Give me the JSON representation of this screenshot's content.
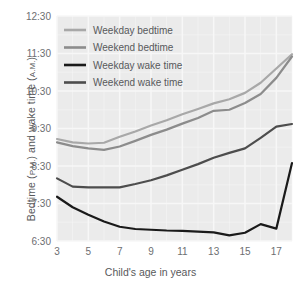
{
  "chart_data": {
    "type": "line",
    "title": "",
    "xlabel": "Child's age in years",
    "ylabel": "Bedtime (P.M.) and wake time (A.M.)",
    "ylabel_main": "Bedtime (",
    "ylabel_pm": "P.M.",
    "ylabel_mid": ") and wake time (",
    "ylabel_am": "A.M.",
    "ylabel_end": ")",
    "grid": true,
    "legend_position": "top-left",
    "xlim": [
      3,
      18
    ],
    "ylim_hours": [
      6.5,
      12.5
    ],
    "x_ticks": [
      "3",
      "5",
      "7",
      "9",
      "11",
      "13",
      "15",
      "17"
    ],
    "x_tick_values": [
      3,
      5,
      7,
      9,
      11,
      13,
      15,
      17
    ],
    "y_ticks": [
      "6:30",
      "7:30",
      "8:30",
      "9:30",
      "10:30",
      "11:30",
      "12:30"
    ],
    "y_tick_values": [
      6.5,
      7.5,
      8.5,
      9.5,
      10.5,
      11.5,
      12.5
    ],
    "x": [
      3,
      4,
      5,
      6,
      7,
      8,
      9,
      10,
      11,
      12,
      13,
      14,
      15,
      16,
      17,
      18
    ],
    "series": [
      {
        "name": "Weekday bedtime",
        "color": "#a8a8a8",
        "values": [
          9.22,
          9.13,
          9.1,
          9.12,
          9.28,
          9.42,
          9.58,
          9.72,
          9.88,
          10.02,
          10.17,
          10.28,
          10.45,
          10.72,
          11.1,
          11.48
        ],
        "value_labels": [
          "9:13",
          "9:08",
          "9:06",
          "9:07",
          "9:17",
          "9:25",
          "9:35",
          "9:43",
          "9:53",
          "10:01",
          "10:10",
          "10:17",
          "10:27",
          "10:43",
          "11:06",
          "11:29"
        ]
      },
      {
        "name": "Weekend bedtime",
        "color": "#8c8c8c",
        "values": [
          9.13,
          9.03,
          8.97,
          8.93,
          9.02,
          9.17,
          9.33,
          9.47,
          9.63,
          9.78,
          9.97,
          10.0,
          10.18,
          10.42,
          10.85,
          11.42
        ],
        "value_labels": [
          "9:08",
          "9:02",
          "8:58",
          "8:56",
          "9:01",
          "9:10",
          "9:20",
          "9:28",
          "9:38",
          "9:47",
          "9:58",
          "10:00",
          "10:11",
          "10:25",
          "10:51",
          "11:25"
        ]
      },
      {
        "name": "Weekday wake time",
        "color": "#1a1a1a",
        "values": [
          7.68,
          7.4,
          7.2,
          7.02,
          6.88,
          6.82,
          6.8,
          6.78,
          6.77,
          6.75,
          6.73,
          6.65,
          6.72,
          6.95,
          6.83,
          8.58
        ],
        "value_labels": [
          "7:41",
          "7:24",
          "7:12",
          "7:01",
          "6:53",
          "6:49",
          "6:48",
          "6:47",
          "6:46",
          "6:45",
          "6:44",
          "6:39",
          "6:43",
          "6:57",
          "6:50",
          "8:35"
        ]
      },
      {
        "name": "Weekend wake time",
        "color": "#4d4d4d",
        "values": [
          8.17,
          7.95,
          7.93,
          7.93,
          7.93,
          8.02,
          8.12,
          8.25,
          8.4,
          8.55,
          8.72,
          8.85,
          8.97,
          9.25,
          9.55,
          9.62
        ],
        "value_labels": [
          "8:10",
          "7:57",
          "7:56",
          "7:56",
          "7:56",
          "8:01",
          "8:07",
          "8:15",
          "8:24",
          "8:33",
          "8:43",
          "8:51",
          "8:58",
          "9:15",
          "9:33",
          "9:37"
        ]
      }
    ]
  },
  "legend": {
    "items": [
      {
        "label": "Weekday bedtime",
        "color": "#a8a8a8"
      },
      {
        "label": "Weekend bedtime",
        "color": "#8c8c8c"
      },
      {
        "label": "Weekday wake time",
        "color": "#1a1a1a"
      },
      {
        "label": "Weekend wake time",
        "color": "#4d4d4d"
      }
    ]
  },
  "style": {
    "plot_background": "#ebebeb",
    "gridline_color": "#f7f7f7",
    "tick_text_color": "#6d6e71",
    "axis_label_color": "#58595b",
    "figure_background": "#ffffff"
  }
}
